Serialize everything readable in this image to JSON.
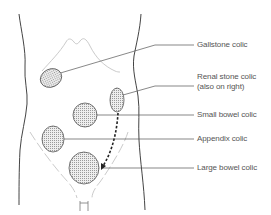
{
  "diagram": {
    "labels": [
      {
        "id": "gallstone",
        "text": "Gallstone colic"
      },
      {
        "id": "renal",
        "text": "Renal stone colic",
        "subtext": "(also on right)"
      },
      {
        "id": "small_bowel",
        "text": "Small bowel colic"
      },
      {
        "id": "appendix",
        "text": "Appendix colic"
      },
      {
        "id": "large_bowel",
        "text": "Large bowel colic"
      }
    ],
    "colors": {
      "outline": "#444444",
      "faint_outline": "#bbbbbb",
      "leader_line": "#555555",
      "text": "#555555",
      "fill_dots": "#999999"
    }
  }
}
